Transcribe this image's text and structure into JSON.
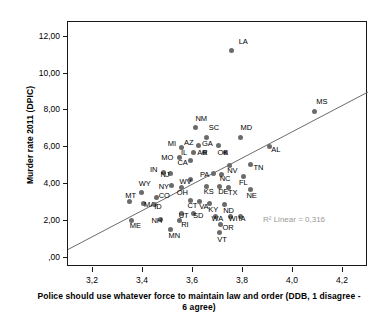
{
  "chart_data": {
    "type": "scatter",
    "title": "",
    "xlabel": "Police should use whatever force to maintain law and order (DDB, 1 disagree - 6 agree)",
    "ylabel": "Murder rate 2011 (DPIC)",
    "xlim": [
      3.1,
      4.3
    ],
    "ylim": [
      -0.5,
      12.8
    ],
    "xticks": [
      "3,2",
      "3,4",
      "3,6",
      "3,8",
      "4,0",
      "4,2"
    ],
    "xtick_values": [
      3.2,
      3.4,
      3.6,
      3.8,
      4.0,
      4.2
    ],
    "yticks": [
      ",00",
      "2,00",
      "4,00",
      "6,00",
      "8,00",
      "10,00",
      "12,00"
    ],
    "ytick_values": [
      0,
      2,
      4,
      6,
      8,
      10,
      12
    ],
    "grid": false,
    "legend": "none",
    "annotation": "R² Linear = 0,316",
    "annotation_color": "#9a9a9a",
    "point_color": "#6b6b6b",
    "fit_line_color": "#6b6b6b",
    "fit_line": {
      "type": "linear",
      "x_start": 3.1,
      "y_start": 0.45,
      "x_end": 4.3,
      "y_end": 9.0
    },
    "points": [
      {
        "label": "LA",
        "x": 3.755,
        "y": 11.25,
        "lx": 7,
        "ly": -10
      },
      {
        "label": "MS",
        "x": 4.085,
        "y": 7.95,
        "lx": 2,
        "ly": -10
      },
      {
        "label": "NM",
        "x": 3.61,
        "y": 7.05,
        "lx": 0,
        "ly": -10
      },
      {
        "label": "SC",
        "x": 3.655,
        "y": 6.55,
        "lx": 2,
        "ly": -10
      },
      {
        "label": "MD",
        "x": 3.79,
        "y": 6.55,
        "lx": 0,
        "ly": -10
      },
      {
        "label": "AZ",
        "x": 3.62,
        "y": 6.1,
        "lx": -14,
        "ly": -3
      },
      {
        "label": "GA",
        "x": 3.7,
        "y": 6.1,
        "lx": -16,
        "ly": -2
      },
      {
        "label": "AL",
        "x": 3.905,
        "y": 6.05,
        "lx": 2,
        "ly": 3
      },
      {
        "label": "MI",
        "x": 3.555,
        "y": 6.0,
        "lx": -14,
        "ly": -4
      },
      {
        "label": "IL",
        "x": 3.6,
        "y": 5.7,
        "lx": -12,
        "ly": -1
      },
      {
        "label": "AR",
        "x": 3.645,
        "y": 5.7,
        "lx": -7,
        "ly": -1
      },
      {
        "label": "OK",
        "x": 3.73,
        "y": 5.7,
        "lx": -8,
        "ly": -1
      },
      {
        "label": "MO",
        "x": 3.545,
        "y": 5.45,
        "lx": -18,
        "ly": 0
      },
      {
        "label": "CA",
        "x": 3.59,
        "y": 5.3,
        "lx": -13,
        "ly": 2
      },
      {
        "label": "NV",
        "x": 3.745,
        "y": 5.0,
        "lx": -2,
        "ly": 4
      },
      {
        "label": "TN",
        "x": 3.83,
        "y": 5.05,
        "lx": 3,
        "ly": 2
      },
      {
        "label": "IN",
        "x": 3.48,
        "y": 4.65,
        "lx": -13,
        "ly": -3
      },
      {
        "label": "NJ",
        "x": 3.51,
        "y": 4.55,
        "lx": -10,
        "ly": 0
      },
      {
        "label": "PA",
        "x": 3.68,
        "y": 4.6,
        "lx": -13,
        "ly": 1
      },
      {
        "label": "NC",
        "x": 3.715,
        "y": 4.5,
        "lx": -2,
        "ly": 3
      },
      {
        "label": "FL",
        "x": 3.8,
        "y": 4.4,
        "lx": -4,
        "ly": 5
      },
      {
        "label": "WV",
        "x": 3.59,
        "y": 4.25,
        "lx": -11,
        "ly": 1
      },
      {
        "label": "NY",
        "x": 3.515,
        "y": 3.95,
        "lx": -13,
        "ly": 1
      },
      {
        "label": "OH",
        "x": 3.555,
        "y": 3.8,
        "lx": -5,
        "ly": 4
      },
      {
        "label": "KS",
        "x": 3.655,
        "y": 3.85,
        "lx": -3,
        "ly": 4
      },
      {
        "label": "DE",
        "x": 3.705,
        "y": 3.85,
        "lx": -1,
        "ly": 4
      },
      {
        "label": "TX",
        "x": 3.74,
        "y": 3.8,
        "lx": 0,
        "ly": 4
      },
      {
        "label": "NE",
        "x": 3.83,
        "y": 3.7,
        "lx": -4,
        "ly": 5
      },
      {
        "label": "WY",
        "x": 3.395,
        "y": 3.55,
        "lx": -3,
        "ly": -9
      },
      {
        "label": "CO",
        "x": 3.455,
        "y": 3.3,
        "lx": 2,
        "ly": -2
      },
      {
        "label": "MT",
        "x": 3.345,
        "y": 3.05,
        "lx": -4,
        "ly": -7
      },
      {
        "label": "MA",
        "x": 3.4,
        "y": 2.95,
        "lx": 1,
        "ly": 1
      },
      {
        "label": "ID",
        "x": 3.445,
        "y": 2.9,
        "lx": 0,
        "ly": 2
      },
      {
        "label": "CT",
        "x": 3.59,
        "y": 3.1,
        "lx": -3,
        "ly": 4
      },
      {
        "label": "VA",
        "x": 3.625,
        "y": 3.05,
        "lx": 0,
        "ly": 4
      },
      {
        "label": "KY",
        "x": 3.665,
        "y": 2.95,
        "lx": -1,
        "ly": 6
      },
      {
        "label": "ND",
        "x": 3.725,
        "y": 2.9,
        "lx": -1,
        "ly": 6
      },
      {
        "label": "UT",
        "x": 3.555,
        "y": 2.4,
        "lx": -3,
        "ly": 1
      },
      {
        "label": "SD",
        "x": 3.6,
        "y": 2.4,
        "lx": 0,
        "ly": 1
      },
      {
        "label": "WA",
        "x": 3.69,
        "y": 2.25,
        "lx": -4,
        "ly": 2
      },
      {
        "label": "WI",
        "x": 3.75,
        "y": 2.25,
        "lx": -2,
        "ly": 2
      },
      {
        "label": "IA",
        "x": 3.79,
        "y": 2.25,
        "lx": -2,
        "ly": 2
      },
      {
        "label": "ME",
        "x": 3.355,
        "y": 2.05,
        "lx": -2,
        "ly": 5
      },
      {
        "label": "NH",
        "x": 3.47,
        "y": 2.1,
        "lx": -9,
        "ly": 1
      },
      {
        "label": "RI",
        "x": 3.545,
        "y": 2.0,
        "lx": 2,
        "ly": 3
      },
      {
        "label": "OR",
        "x": 3.71,
        "y": 1.8,
        "lx": 2,
        "ly": 2
      },
      {
        "label": "MN",
        "x": 3.51,
        "y": 1.55,
        "lx": -2,
        "ly": 6
      },
      {
        "label": "VT",
        "x": 3.705,
        "y": 1.35,
        "lx": -2,
        "ly": 6
      }
    ]
  }
}
